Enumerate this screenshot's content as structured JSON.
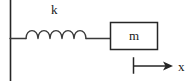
{
  "figure": {
    "type": "physics-schematic",
    "background_color": "#ffffff",
    "stroke_color": "#262626",
    "labels": {
      "spring_constant": "k",
      "mass": "m",
      "displacement_axis": "x"
    },
    "elements": {
      "wall": {
        "name": "fixed-wall",
        "orientation": "vertical",
        "x": 10,
        "y_top": 0,
        "y_bottom": 81
      },
      "spring": {
        "name": "coil-spring",
        "coil_count": 5,
        "baseline_y": 38,
        "x_start": 10,
        "x_end": 110,
        "coils_x_start": 26,
        "coils_x_end": 86
      },
      "mass_block": {
        "name": "mass-block",
        "x": 110,
        "y": 22,
        "width": 48,
        "height": 28
      },
      "axis_arrow": {
        "name": "displacement-arrow",
        "tick_x": 133,
        "tick_y_top": 58,
        "tick_y_bottom": 73,
        "line_y": 66,
        "arrow_tip_x": 173,
        "direction": "right"
      }
    }
  }
}
